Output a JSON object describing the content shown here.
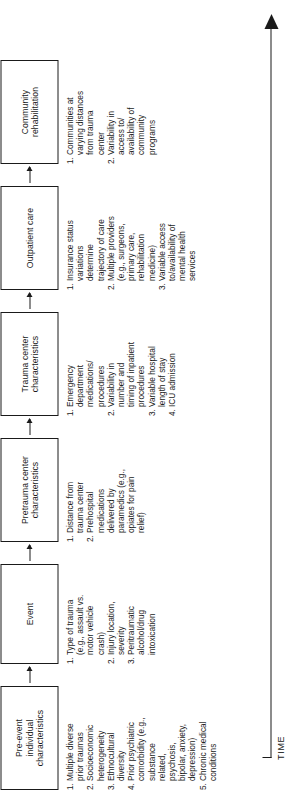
{
  "figure": {
    "type": "flowchart",
    "orientation": "vertical-rotated",
    "timeline": {
      "label": "TIME",
      "direction": "left-to-right"
    },
    "arrow_glyph": "→",
    "line_color": "#1a1a1a",
    "background_color": "#ffffff"
  },
  "stages": [
    {
      "id": "pre-event",
      "title": "Pre-event\nindividual\ncharacteristics",
      "items": [
        {
          "num": "1.",
          "text": "Multiple diverse\nprior traumas"
        },
        {
          "num": "2.",
          "text": "Socioeconomic\nheterogeneity"
        },
        {
          "num": "3.",
          "text": "Ethnocultural\ndiversity"
        },
        {
          "num": "4.",
          "text": "Prior psychiatric\ncomorbidity (e.g.,\nsubstance\nrelated,\npsychosis,\nbipolar, anxiety,\ndepression)"
        },
        {
          "num": "5.",
          "text": "Chronic medical\nconditions"
        }
      ]
    },
    {
      "id": "event",
      "title": "Event",
      "items": [
        {
          "num": "1.",
          "text": "Type of trauma\n(e.g., assault vs.\nmotor vehicle\ncrash)"
        },
        {
          "num": "2.",
          "text": "Injury location,\nseverity"
        },
        {
          "num": "3.",
          "text": "Peritraumatic\nalcohol/drug\nintoxication"
        }
      ]
    },
    {
      "id": "pretrauma-center",
      "title": "Pretrauma center\ncharacteristics",
      "items": [
        {
          "num": "1.",
          "text": "Distance from\ntrauma center"
        },
        {
          "num": "2.",
          "text": "Prehospital\nmedications\ndelivered by\nparamedics (e.g.,\nopiates for pain\nrelief)"
        }
      ]
    },
    {
      "id": "trauma-center",
      "title": "Trauma center\ncharacteristics",
      "items": [
        {
          "num": "1.",
          "text": "Emergency\ndepartment\nmedications/\nprocedures"
        },
        {
          "num": "2.",
          "text": "Variability in\nnumber and\ntiming of inpatient\nprocedures"
        },
        {
          "num": "3.",
          "text": "Variable hospital\nlength of stay"
        },
        {
          "num": "4.",
          "text": "ICU admission"
        }
      ]
    },
    {
      "id": "outpatient-care",
      "title": "Outpatient care",
      "items": [
        {
          "num": "1.",
          "text": "Insurance status\nvariations\ndetermine\ntrajectory of care"
        },
        {
          "num": "2.",
          "text": "Multiple providers\n(e.g., surgeons,\nprimary care,\nrehabilitation\nmedicine)"
        },
        {
          "num": "3.",
          "text": "Variable access\nto/availability of\nmental health\nservices"
        }
      ]
    },
    {
      "id": "community-rehabilitation",
      "title": "Community\nrehabilitation",
      "items": [
        {
          "num": "1.",
          "text": "Communities at\nvarying distances\nfrom trauma\ncenter"
        },
        {
          "num": "2.",
          "text": "Variability in\naccess to/\navailability of\ncommunity\nprograms"
        }
      ]
    }
  ]
}
